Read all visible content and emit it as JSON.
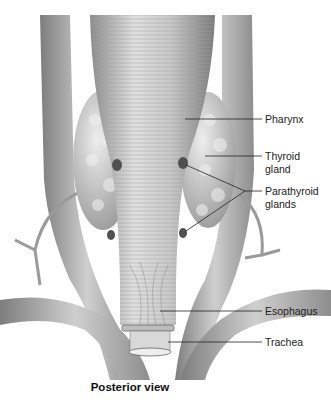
{
  "figure": {
    "caption": "Posterior view",
    "colors": {
      "background": "#ffffff",
      "tissue_light": "#d9d9d9",
      "tissue_mid": "#a8a8a8",
      "tissue_dark": "#6e6e6e",
      "gland_dark": "#4a4a4a",
      "leader_line": "#222222"
    },
    "labels": [
      {
        "id": "pharynx",
        "text": "Pharynx"
      },
      {
        "id": "thyroid",
        "line1": "Thyroid",
        "line2": "gland"
      },
      {
        "id": "parathyroid",
        "line1": "Parathyroid",
        "line2": "glands"
      },
      {
        "id": "esophagus",
        "text": "Esophagus"
      },
      {
        "id": "trachea",
        "text": "Trachea"
      }
    ]
  }
}
